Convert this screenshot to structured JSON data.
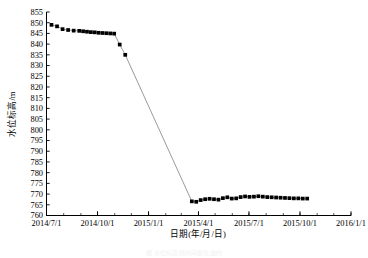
{
  "chart_data": {
    "type": "line",
    "title": "",
    "xlabel": "日期(年/月/日)",
    "ylabel": "水位标高/m",
    "ylim": [
      760,
      855
    ],
    "ytick_step": 5,
    "yticks": [
      760,
      765,
      770,
      775,
      780,
      785,
      790,
      795,
      800,
      805,
      810,
      815,
      820,
      825,
      830,
      835,
      840,
      845,
      850,
      855
    ],
    "xlim": [
      "2014/7/1",
      "2016/1/1"
    ],
    "xticks": [
      "2014/7/1",
      "2014/10/1",
      "2015/1/1",
      "2015/4/1",
      "2015/7/1",
      "2015/10/1",
      "2016/1/1"
    ],
    "grid": false,
    "legend": null,
    "marker": "filled-square",
    "marker_color": "#000000",
    "line_color": "#808080",
    "series": [
      {
        "name": "水位标高",
        "x": [
          "2014/7/10",
          "2014/7/20",
          "2014/7/30",
          "2014/8/9",
          "2014/8/19",
          "2014/8/29",
          "2014/9/5",
          "2014/9/12",
          "2014/9/19",
          "2014/9/26",
          "2014/10/3",
          "2014/10/10",
          "2014/10/17",
          "2014/10/24",
          "2014/10/31",
          "2014/11/10",
          "2014/11/20",
          "2015/3/20",
          "2015/3/28",
          "2015/4/5",
          "2015/4/13",
          "2015/4/21",
          "2015/4/29",
          "2015/5/7",
          "2015/5/15",
          "2015/5/23",
          "2015/5/31",
          "2015/6/8",
          "2015/6/16",
          "2015/6/24",
          "2015/7/2",
          "2015/7/10",
          "2015/7/18",
          "2015/7/26",
          "2015/8/3",
          "2015/8/11",
          "2015/8/19",
          "2015/8/27",
          "2015/9/4",
          "2015/9/12",
          "2015/9/20",
          "2015/9/28",
          "2015/10/6",
          "2015/10/14"
        ],
        "y": [
          849.0,
          848.3,
          847.0,
          846.6,
          846.3,
          846.2,
          846.0,
          845.8,
          845.6,
          845.5,
          845.3,
          845.2,
          845.1,
          845.0,
          844.9,
          839.8,
          835.0,
          766.6,
          766.4,
          767.2,
          767.6,
          767.8,
          767.6,
          767.4,
          768.1,
          768.5,
          767.9,
          768.0,
          768.6,
          768.9,
          768.7,
          768.8,
          769.0,
          768.8,
          768.6,
          768.5,
          768.4,
          768.3,
          768.2,
          768.1,
          768.0,
          768.0,
          767.9,
          767.9
        ]
      }
    ]
  },
  "caption": {
    "text": "图 水位标高随时间变化曲线"
  }
}
